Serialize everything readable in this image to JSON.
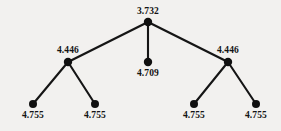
{
  "figure": {
    "type": "tree-diagram",
    "background_color": "#f2f1ef",
    "node_color": "#101010",
    "edge_color": "#151515"
  },
  "chart_data": {
    "type": "diagram",
    "title": "",
    "nodes": [
      {
        "id": "root",
        "label": "3.732",
        "x": 148,
        "y": 22,
        "level": 0,
        "kind": "root"
      },
      {
        "id": "l1",
        "label": "4.446",
        "x": 68,
        "y": 62,
        "level": 1,
        "kind": "internal"
      },
      {
        "id": "m1",
        "label": "4.709",
        "x": 148,
        "y": 62,
        "level": 1,
        "kind": "leaf"
      },
      {
        "id": "r1",
        "label": "4.446",
        "x": 228,
        "y": 62,
        "level": 1,
        "kind": "internal"
      },
      {
        "id": "l1a",
        "label": "4.755",
        "x": 33,
        "y": 104,
        "level": 2,
        "kind": "leaf"
      },
      {
        "id": "l1b",
        "label": "4.755",
        "x": 95,
        "y": 104,
        "level": 2,
        "kind": "leaf"
      },
      {
        "id": "r1a",
        "label": "4.755",
        "x": 194,
        "y": 104,
        "level": 2,
        "kind": "leaf"
      },
      {
        "id": "r1b",
        "label": "4.755",
        "x": 256,
        "y": 104,
        "level": 2,
        "kind": "leaf"
      }
    ],
    "edges": [
      {
        "from": "root",
        "to": "l1"
      },
      {
        "from": "root",
        "to": "m1"
      },
      {
        "from": "root",
        "to": "r1"
      },
      {
        "from": "l1",
        "to": "l1a"
      },
      {
        "from": "l1",
        "to": "l1b"
      },
      {
        "from": "r1",
        "to": "r1a"
      },
      {
        "from": "r1",
        "to": "r1b"
      }
    ],
    "labels": {
      "root": "3.732",
      "left_internal": "4.446",
      "middle_leaf": "4.709",
      "right_internal": "4.446",
      "leaf_1": "4.755",
      "leaf_2": "4.755",
      "leaf_3": "4.755",
      "leaf_4": "4.755"
    }
  }
}
